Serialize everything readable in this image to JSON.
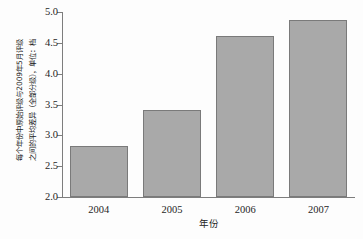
{
  "chart_data": {
    "type": "bar",
    "title": "",
    "categories": [
      "2004",
      "2005",
      "2006",
      "2007"
    ],
    "values": [
      2.82,
      3.41,
      4.61,
      4.87
    ],
    "xlabel": "年份",
    "ylabel": "每个年份中原始评级与2009年5月评级之间的平均差异（全部分级），单位：档",
    "ylabel_lines": [
      "每个年份中原始评级与2009年5月评级",
      "之间的平均差异（全部分级），单位：档"
    ],
    "ylim": [
      2.0,
      5.0
    ],
    "ytick_labels": [
      "2.0",
      "2.5",
      "3.0",
      "3.5",
      "4.0",
      "4.5",
      "5.0"
    ],
    "ytick_values": [
      2.0,
      2.5,
      3.0,
      3.5,
      4.0,
      4.5,
      5.0
    ],
    "grid": false,
    "legend": false,
    "bar_color": "#a9a9a9",
    "bar_edge_color": "#7a7a7a",
    "axis_color": "#7d7d7d"
  }
}
